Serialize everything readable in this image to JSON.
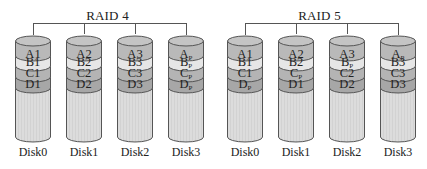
{
  "colors": {
    "band_a": "#b9b9b9",
    "band_b": "#e6e6e6",
    "band_c": "#b4b4b4",
    "band_d": "#a7a7a7",
    "body": "#dcdcdc",
    "top": "#c4c4c4",
    "outline": "#555555"
  },
  "groups": [
    {
      "title": "RAID 4",
      "disks": [
        {
          "name": "Disk0",
          "blocks": [
            {
              "t": "A1",
              "p": false
            },
            {
              "t": "B1",
              "p": false
            },
            {
              "t": "C1",
              "p": false
            },
            {
              "t": "D1",
              "p": false
            }
          ]
        },
        {
          "name": "Disk1",
          "blocks": [
            {
              "t": "A2",
              "p": false
            },
            {
              "t": "B2",
              "p": false
            },
            {
              "t": "C2",
              "p": false
            },
            {
              "t": "D2",
              "p": false
            }
          ]
        },
        {
          "name": "Disk2",
          "blocks": [
            {
              "t": "A3",
              "p": false
            },
            {
              "t": "B3",
              "p": false
            },
            {
              "t": "C3",
              "p": false
            },
            {
              "t": "D3",
              "p": false
            }
          ]
        },
        {
          "name": "Disk3",
          "blocks": [
            {
              "t": "A",
              "sub": "P",
              "p": true
            },
            {
              "t": "B",
              "sub": "P",
              "p": true
            },
            {
              "t": "C",
              "sub": "P",
              "p": true
            },
            {
              "t": "D",
              "sub": "P",
              "p": true
            }
          ]
        }
      ]
    },
    {
      "title": "RAID 5",
      "disks": [
        {
          "name": "Disk0",
          "blocks": [
            {
              "t": "A1",
              "p": false
            },
            {
              "t": "B1",
              "p": false
            },
            {
              "t": "C1",
              "p": false
            },
            {
              "t": "D",
              "sub": "P",
              "p": true
            }
          ]
        },
        {
          "name": "Disk1",
          "blocks": [
            {
              "t": "A2",
              "p": false
            },
            {
              "t": "B2",
              "p": false
            },
            {
              "t": "C",
              "sub": "P",
              "p": true
            },
            {
              "t": "D1",
              "p": false
            }
          ]
        },
        {
          "name": "Disk2",
          "blocks": [
            {
              "t": "A3",
              "p": false
            },
            {
              "t": "B",
              "sub": "P",
              "p": true
            },
            {
              "t": "C2",
              "p": false
            },
            {
              "t": "D2",
              "p": false
            }
          ]
        },
        {
          "name": "Disk3",
          "blocks": [
            {
              "t": "A",
              "sub": "P",
              "p": true
            },
            {
              "t": "B3",
              "p": false
            },
            {
              "t": "C3",
              "p": false
            },
            {
              "t": "D3",
              "p": false
            }
          ]
        }
      ]
    }
  ]
}
